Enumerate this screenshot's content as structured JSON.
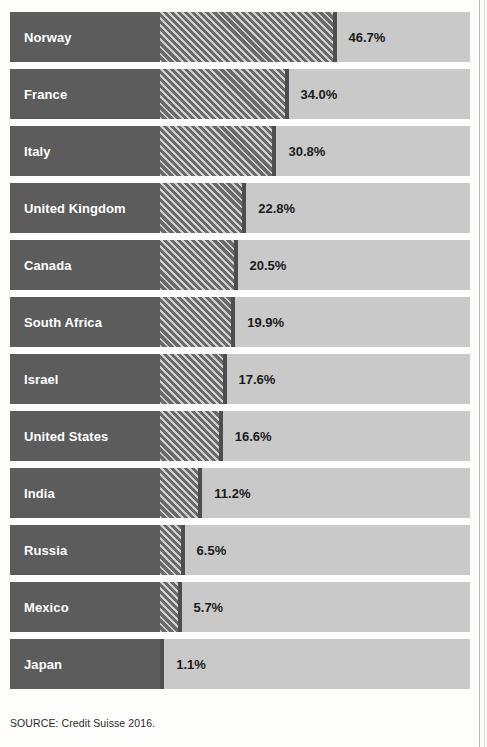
{
  "chart_data": {
    "type": "bar",
    "orientation": "horizontal",
    "title": "",
    "subtitle": "",
    "xlabel": "",
    "ylabel": "",
    "xlim": [
      0,
      82
    ],
    "grid": false,
    "legend": null,
    "value_suffix": "%",
    "categories": [
      "Norway",
      "France",
      "Italy",
      "United Kingdom",
      "Canada",
      "South Africa",
      "Israel",
      "United States",
      "India",
      "Russia",
      "Mexico",
      "Japan"
    ],
    "values": [
      46.7,
      34.0,
      30.8,
      22.8,
      20.5,
      19.9,
      17.6,
      16.6,
      11.2,
      6.5,
      5.7,
      1.1
    ],
    "value_labels": [
      "46.7%",
      "34.0%",
      "30.8%",
      "22.8%",
      "20.5%",
      "19.9%",
      "17.6%",
      "16.6%",
      "11.2%",
      "6.5%",
      "5.7%",
      "1.1%"
    ],
    "bars": [
      {
        "label": "Norway",
        "value": 46.7,
        "value_label": "46.7%"
      },
      {
        "label": "France",
        "value": 34.0,
        "value_label": "34.0%"
      },
      {
        "label": "Italy",
        "value": 30.8,
        "value_label": "30.8%"
      },
      {
        "label": "United Kingdom",
        "value": 22.8,
        "value_label": "22.8%"
      },
      {
        "label": "Canada",
        "value": 20.5,
        "value_label": "20.5%"
      },
      {
        "label": "South Africa",
        "value": 19.9,
        "value_label": "19.9%"
      },
      {
        "label": "Israel",
        "value": 17.6,
        "value_label": "17.6%"
      },
      {
        "label": "United States",
        "value": 16.6,
        "value_label": "16.6%"
      },
      {
        "label": "India",
        "value": 11.2,
        "value_label": "11.2%"
      },
      {
        "label": "Russia",
        "value": 6.5,
        "value_label": "6.5%"
      },
      {
        "label": "Mexico",
        "value": 5.7,
        "value_label": "5.7%"
      },
      {
        "label": "Japan",
        "value": 1.1,
        "value_label": "1.1%"
      }
    ],
    "colors": {
      "label_block": "#5c5c5c",
      "label_text": "#ffffff",
      "bar_fill": "#6a6a6a",
      "bar_hatch": "#cfcfcf",
      "bar_cap": "#4e4e4e",
      "track": "#c9c9c9",
      "value_text": "#1b1b1b",
      "background": "#fdfdfc"
    }
  },
  "source": {
    "text": "SOURCE: Credit Suisse 2016."
  }
}
